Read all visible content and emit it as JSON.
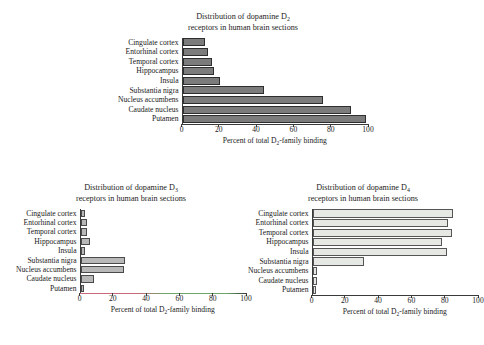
{
  "figure": {
    "categories": [
      "Cingulate cortex",
      "Entorhinal cortex",
      "Temporal cortex",
      "Hippocampus",
      "Insula",
      "Substantia nigra",
      "Nucleus accumbens",
      "Caudate nucleus",
      "Putamen"
    ],
    "axis_ticks": [
      "0",
      "20",
      "40",
      "60",
      "80",
      "100"
    ],
    "axis_title_prefix": "Percent of total D",
    "axis_title_sub": "2",
    "axis_title_suffix": "-family binding",
    "title_line1_prefix": "Distribution of dopamine D",
    "title_line2": "receptors in human brain sections"
  },
  "panels": {
    "d2": {
      "receptor_sub": "2",
      "bar_style": "dark",
      "bar_color": "#7c7c7c",
      "border_color": "#2e2e2e"
    },
    "d3": {
      "receptor_sub": "3",
      "bar_style": "mid",
      "bar_color": "#b8b8b8",
      "border_color": "#4a4a4a"
    },
    "d4": {
      "receptor_sub": "4",
      "bar_style": "light",
      "bar_color": "#e6e8e4",
      "border_color": "#555555"
    }
  },
  "chart_data": [
    {
      "type": "bar",
      "orientation": "horizontal",
      "id": "d2",
      "title": "Distribution of dopamine D2 receptors in human brain sections",
      "xlabel": "Percent of total D2-family binding",
      "ylabel": "",
      "xlim": [
        0,
        100
      ],
      "xticks": [
        0,
        20,
        40,
        60,
        80,
        100
      ],
      "grid": false,
      "legend": "none",
      "categories": [
        "Cingulate cortex",
        "Entorhinal cortex",
        "Temporal cortex",
        "Hippocampus",
        "Insula",
        "Substantia nigra",
        "Nucleus accumbens",
        "Caudate nucleus",
        "Putamen"
      ],
      "values": [
        12,
        14,
        16,
        17,
        20,
        44,
        76,
        91,
        99
      ]
    },
    {
      "type": "bar",
      "orientation": "horizontal",
      "id": "d3",
      "title": "Distribution of dopamine D3 receptors in human brain sections",
      "xlabel": "Percent of total D2-family binding",
      "ylabel": "",
      "xlim": [
        0,
        100
      ],
      "xticks": [
        0,
        20,
        40,
        60,
        80,
        100
      ],
      "grid": false,
      "legend": "none",
      "categories": [
        "Cingulate cortex",
        "Entorhinal cortex",
        "Temporal cortex",
        "Hippocampus",
        "Insula",
        "Substantia nigra",
        "Nucleus accumbens",
        "Caudate nucleus",
        "Putamen"
      ],
      "values": [
        3,
        4,
        4,
        6,
        3,
        27,
        26,
        8,
        2
      ]
    },
    {
      "type": "bar",
      "orientation": "horizontal",
      "id": "d4",
      "title": "Distribution of dopamine D4 receptors in human brain sections",
      "xlabel": "Percent of total D2-family binding",
      "ylabel": "",
      "xlim": [
        0,
        100
      ],
      "xticks": [
        0,
        20,
        40,
        60,
        80,
        100
      ],
      "grid": false,
      "legend": "none",
      "categories": [
        "Cingulate cortex",
        "Entorhinal cortex",
        "Temporal cortex",
        "Hippocampus",
        "Insula",
        "Substantia nigra",
        "Nucleus accumbens",
        "Caudate nucleus",
        "Putamen"
      ],
      "values": [
        85,
        82,
        84,
        78,
        81,
        31,
        3,
        3,
        2
      ]
    }
  ]
}
